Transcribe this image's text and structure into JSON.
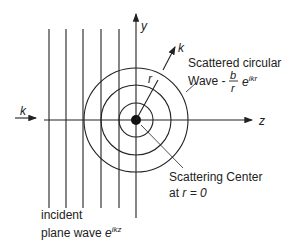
{
  "diagram": {
    "axes": {
      "y_label": "y",
      "z_label": "z",
      "k_incident_label": "k",
      "k_scattered_label": "k",
      "r_label": "r"
    },
    "labels": {
      "scattered_line1": "Scattered circular",
      "scattered_line2_prefix": "Wave -",
      "scattered_frac_num": "b",
      "scattered_frac_den": "r",
      "scattered_exp_base": "e",
      "scattered_exp_sup": "ikr",
      "center_line1": "Scattering Center",
      "center_line2_prefix": "at ",
      "center_line2_math": "r = 0",
      "incident_line1": "incident",
      "incident_line2_prefix": "plane wave ",
      "incident_exp_base": "e",
      "incident_exp_sup": "ikz"
    },
    "geometry": {
      "center": [
        136,
        120
      ],
      "circle_radii": [
        17,
        35,
        52
      ],
      "wavefront_x": [
        49,
        66,
        83,
        101,
        119
      ]
    },
    "colors": {
      "line": "#222222"
    }
  }
}
